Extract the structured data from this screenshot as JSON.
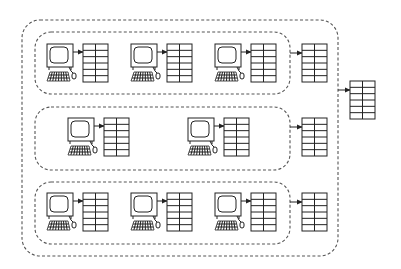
{
  "diagram": {
    "colors": {
      "line": "#222222",
      "dashed_border": "#555555",
      "background": "#ffffff"
    },
    "outer_group": {
      "x": 22,
      "y": 20,
      "w": 316,
      "h": 236,
      "r": 18
    },
    "groups": [
      {
        "id": "group-1",
        "box": {
          "x": 35,
          "y": 32,
          "w": 255,
          "h": 62,
          "r": 16
        },
        "workstations": [
          {
            "computer_x": 47,
            "table_x": 83
          },
          {
            "computer_x": 131,
            "table_x": 167
          },
          {
            "computer_x": 215,
            "table_x": 251
          }
        ],
        "row_y": 44,
        "aggregate_table": {
          "x": 302,
          "y": 44
        }
      },
      {
        "id": "group-2",
        "box": {
          "x": 35,
          "y": 107,
          "w": 255,
          "h": 63,
          "r": 16
        },
        "workstations": [
          {
            "computer_x": 68,
            "table_x": 104
          },
          {
            "computer_x": 188,
            "table_x": 224
          }
        ],
        "row_y": 118,
        "aggregate_table": {
          "x": 302,
          "y": 118
        }
      },
      {
        "id": "group-3",
        "box": {
          "x": 35,
          "y": 182,
          "w": 255,
          "h": 62,
          "r": 16
        },
        "workstations": [
          {
            "computer_x": 47,
            "table_x": 83
          },
          {
            "computer_x": 131,
            "table_x": 167
          },
          {
            "computer_x": 215,
            "table_x": 251
          }
        ],
        "row_y": 193,
        "aggregate_table": {
          "x": 302,
          "y": 193
        }
      }
    ],
    "master_table": {
      "x": 350,
      "y": 81
    },
    "table_spec": {
      "w": 25,
      "h": 38,
      "cols": 2,
      "rows": 6
    },
    "icons": {
      "workstation": "computer-icon",
      "table": "data-table-icon",
      "arrow": "arrow-right-icon"
    }
  }
}
